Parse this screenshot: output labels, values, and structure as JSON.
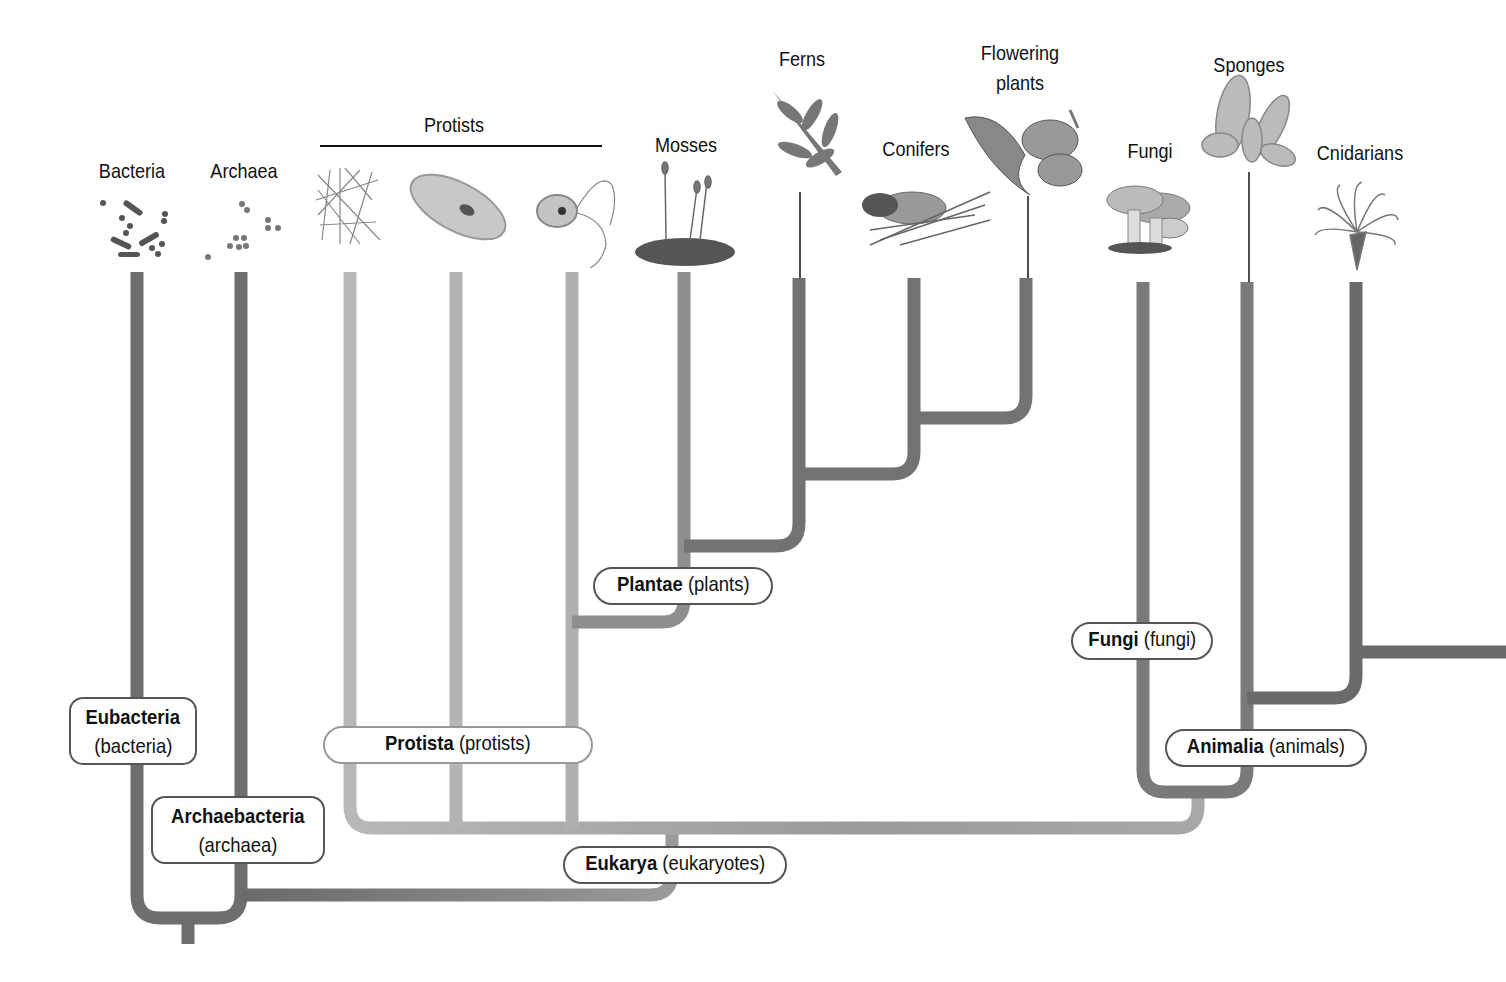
{
  "diagram": {
    "type": "phylogenetic-tree",
    "taxa": [
      {
        "label": "Bacteria",
        "icon": "bacteria-icon"
      },
      {
        "label": "Archaea",
        "icon": "archaea-icon"
      },
      {
        "label": "Protists",
        "icon": "protists-icon",
        "members": [
          "slime-mold-icon",
          "paramecium-icon",
          "flagellate-icon"
        ]
      },
      {
        "label": "Mosses",
        "icon": "moss-icon"
      },
      {
        "label": "Ferns",
        "icon": "fern-icon"
      },
      {
        "label": "Conifers",
        "icon": "pinecone-icon"
      },
      {
        "label": "Flowering plants",
        "label_line1": "Flowering",
        "label_line2": "plants",
        "icon": "flower-icon"
      },
      {
        "label": "Fungi",
        "icon": "mushroom-icon"
      },
      {
        "label": "Sponges",
        "icon": "sponge-icon"
      },
      {
        "label": "Cnidarians",
        "icon": "anemone-icon"
      }
    ],
    "groups": [
      {
        "bold": "Eubacteria",
        "common": "(bacteria)"
      },
      {
        "bold": "Archaebacteria",
        "common": "(archaea)"
      },
      {
        "bold": "Protista",
        "common": "(protists)"
      },
      {
        "bold": "Plantae",
        "common": "(plants)"
      },
      {
        "bold": "Fungi",
        "common": "(fungi)"
      },
      {
        "bold": "Animalia",
        "common": "(animals)"
      },
      {
        "bold": "Eukarya",
        "common": "(eukaryotes)"
      }
    ],
    "colors": {
      "dark_branch": "#6e6e6e",
      "light_branch": "#b4b4b4",
      "mid_branch": "#8c8c8c",
      "box_border": "#555555",
      "text": "#111111"
    }
  }
}
